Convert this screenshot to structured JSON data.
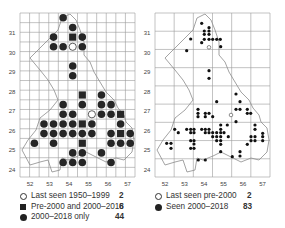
{
  "left_map": {
    "x_ticks": [
      "52",
      "53",
      "54",
      "55",
      "56",
      "57"
    ],
    "y_ticks": [
      "31",
      "30",
      "29",
      "28",
      "27",
      "26",
      "25",
      "24"
    ],
    "legend": [
      {
        "symbol": "open-circle",
        "label": "Last seen 1950–1999",
        "count": "2"
      },
      {
        "symbol": "filled-square",
        "label": "Pre-2000 and 2000–2018",
        "count": "6"
      },
      {
        "symbol": "filled-circle",
        "label": "2000–2018 only",
        "count": "44"
      }
    ]
  },
  "right_map": {
    "x_ticks": [
      "52",
      "53",
      "54",
      "55",
      "56",
      "57"
    ],
    "y_ticks": [
      "31",
      "30",
      "29",
      "28",
      "27",
      "26",
      "25",
      "24"
    ],
    "legend": [
      {
        "symbol": "open-circle",
        "label": "Last seen pre-2000",
        "count": "2"
      },
      {
        "symbol": "filled-circle",
        "label": "Seen 2000–2018",
        "count": "83"
      }
    ]
  },
  "chart_data": [
    {
      "type": "scatter",
      "title": "Grid-square occupancy map (half-degree squares)",
      "xlabel": "Longitude (°E)",
      "ylabel": "Latitude (°N)",
      "x_ticks": [
        52,
        53,
        54,
        55,
        56,
        57
      ],
      "y_ticks": [
        24,
        25,
        26,
        27,
        28,
        29,
        30,
        31
      ],
      "grid": true,
      "legend_position": "bottom",
      "series": [
        {
          "name": "Last seen 1950–1999",
          "marker": "open-circle",
          "count": 2,
          "cells": [
            [
              3,
              5
            ],
            [
              10,
              7
            ]
          ]
        },
        {
          "name": "Pre-2000 and 2000–2018",
          "marker": "filled-square",
          "count": 6,
          "cells": [
            [
              2,
              5
            ],
            [
              8,
              6
            ],
            [
              10,
              10
            ],
            [
              11,
              6
            ],
            [
              12,
              10
            ],
            [
              13,
              6
            ]
          ]
        },
        {
          "name": "2000–2018 only",
          "marker": "filled-circle",
          "count": 44,
          "cells": [
            [
              0,
              4
            ],
            [
              1,
              5
            ],
            [
              2,
              3
            ],
            [
              2,
              6
            ],
            [
              3,
              3
            ],
            [
              3,
              4
            ],
            [
              3,
              6
            ],
            [
              5,
              5
            ],
            [
              6,
              5
            ],
            [
              8,
              8
            ],
            [
              9,
              4
            ],
            [
              9,
              6
            ],
            [
              9,
              8
            ],
            [
              9,
              9
            ],
            [
              10,
              4
            ],
            [
              10,
              5
            ],
            [
              10,
              8
            ],
            [
              10,
              9
            ],
            [
              11,
              2
            ],
            [
              11,
              3
            ],
            [
              11,
              4
            ],
            [
              11,
              5
            ],
            [
              11,
              7
            ],
            [
              11,
              10
            ],
            [
              12,
              2
            ],
            [
              12,
              3
            ],
            [
              12,
              4
            ],
            [
              12,
              5
            ],
            [
              12,
              6
            ],
            [
              12,
              7
            ],
            [
              12,
              9
            ],
            [
              12,
              11
            ],
            [
              13,
              1
            ],
            [
              13,
              3
            ],
            [
              13,
              9
            ],
            [
              13,
              10
            ],
            [
              13,
              11
            ],
            [
              14,
              5
            ],
            [
              14,
              6
            ],
            [
              14,
              8
            ],
            [
              15,
              4
            ],
            [
              15,
              5
            ],
            [
              15,
              6
            ],
            [
              15,
              9
            ]
          ]
        }
      ],
      "cell_index_note": "cells are [row, col] on a 17-row x 12-col half-degree grid, row 0 at top (~31.5°N), col 0 at left (~51.75°E)"
    },
    {
      "type": "scatter",
      "title": "Point-locality map",
      "xlabel": "Longitude (°E)",
      "ylabel": "Latitude (°N)",
      "x_ticks": [
        52,
        53,
        54,
        55,
        56,
        57
      ],
      "y_ticks": [
        24,
        25,
        26,
        27,
        28,
        29,
        30,
        31
      ],
      "grid": true,
      "legend_position": "bottom",
      "series": [
        {
          "name": "Last seen pre-2000",
          "marker": "open-circle",
          "count": 2,
          "points_px": [
            [
              209,
              47.3
            ],
            [
              231,
              115
            ]
          ]
        },
        {
          "name": "Seen 2000–2018",
          "marker": "filled-circle",
          "count": 83,
          "points_px": [
            [
              201.7,
              23.3
            ],
            [
              209,
              27.7
            ],
            [
              204.3,
              31
            ],
            [
              209,
              31
            ],
            [
              204.3,
              34.3
            ],
            [
              209,
              34.3
            ],
            [
              190.7,
              39
            ],
            [
              204.3,
              39.3
            ],
            [
              209,
              39.3
            ],
            [
              212.7,
              39.3
            ],
            [
              216.7,
              39.3
            ],
            [
              220.3,
              39.3
            ],
            [
              201.7,
              42.7
            ],
            [
              220.7,
              46.7
            ],
            [
              186.7,
              50.7
            ],
            [
              209,
              70.7
            ],
            [
              209,
              78.3
            ],
            [
              236,
              94
            ],
            [
              216.7,
              101.7
            ],
            [
              240,
              101.7
            ],
            [
              198,
              109.3
            ],
            [
              236,
              109.3
            ],
            [
              240,
              109.3
            ],
            [
              247.3,
              109.3
            ],
            [
              198,
              113.3
            ],
            [
              205.3,
              113.3
            ],
            [
              209,
              113.3
            ],
            [
              247.3,
              113.3
            ],
            [
              250.7,
              113.3
            ],
            [
              198,
              116.7
            ],
            [
              205.3,
              116.7
            ],
            [
              212.7,
              116.7
            ],
            [
              236,
              121.7
            ],
            [
              220.7,
              125
            ],
            [
              227.3,
              125
            ],
            [
              255,
              125
            ],
            [
              174.7,
              129.3
            ],
            [
              186.7,
              129.3
            ],
            [
              190.7,
              129.3
            ],
            [
              194,
              129.3
            ],
            [
              201.7,
              129.3
            ],
            [
              205.3,
              129.3
            ],
            [
              209,
              129.3
            ],
            [
              220.7,
              129.3
            ],
            [
              255,
              129.3
            ],
            [
              178.3,
              132.7
            ],
            [
              190.7,
              132.7
            ],
            [
              194,
              132.7
            ],
            [
              205.3,
              132.7
            ],
            [
              209,
              132.7
            ],
            [
              212.7,
              132.7
            ],
            [
              216.7,
              132.7
            ],
            [
              220.7,
              132.7
            ],
            [
              224,
              132.7
            ],
            [
              262.7,
              133.3
            ],
            [
              212.7,
              136.7
            ],
            [
              216.7,
              136.7
            ],
            [
              220.7,
              136.7
            ],
            [
              228.3,
              136.7
            ],
            [
              251,
              136.7
            ],
            [
              255,
              136.7
            ],
            [
              262.7,
              136.7
            ],
            [
              190.7,
              140.7
            ],
            [
              194,
              140.7
            ],
            [
              216.7,
              140.7
            ],
            [
              220.7,
              140.7
            ],
            [
              251,
              140.7
            ],
            [
              255,
              140.7
            ],
            [
              262.7,
              140.7
            ],
            [
              166.7,
              143.3
            ],
            [
              171,
              143.3
            ],
            [
              194,
              144
            ],
            [
              220.7,
              144.3
            ],
            [
              247.3,
              144.3
            ],
            [
              171,
              148.3
            ],
            [
              190.7,
              148.3
            ],
            [
              194,
              148.3
            ],
            [
              220.7,
              151.7
            ],
            [
              240,
              151.7
            ],
            [
              232.3,
              156.7
            ],
            [
              240,
              156
            ],
            [
              198.3,
              160
            ],
            [
              205.3,
              160
            ]
          ]
        }
      ]
    }
  ]
}
